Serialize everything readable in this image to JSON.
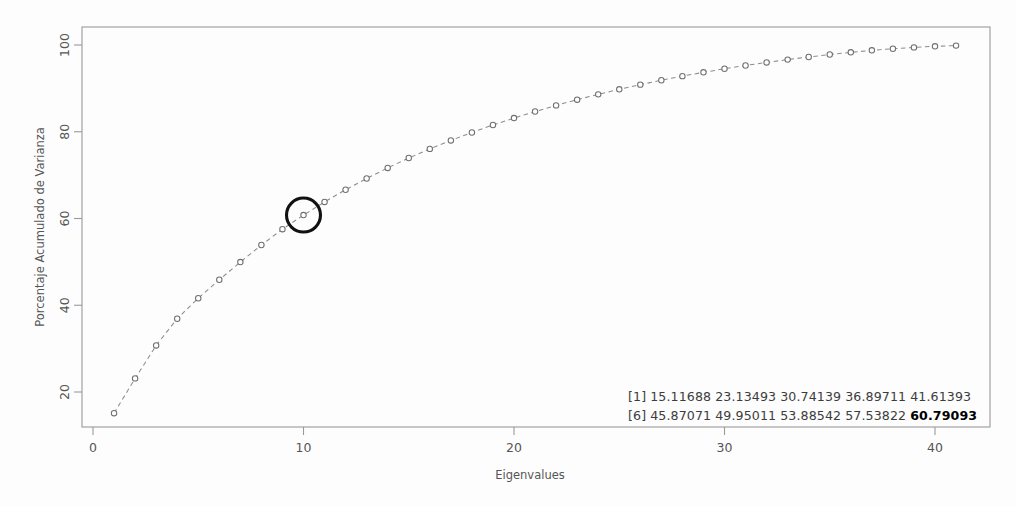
{
  "chart_data": {
    "type": "line",
    "title": "",
    "xlabel": "Eigenvalues",
    "ylabel": "Porcentaje Acumulado de Varianza",
    "xlim": [
      0,
      42.5
    ],
    "ylim": [
      12,
      104
    ],
    "grid": false,
    "legend": "none",
    "marker": "open-circle",
    "linestyle": "dashed",
    "xticks": [
      0,
      10,
      20,
      30,
      40
    ],
    "xtick_labels": [
      "0",
      "10",
      "20",
      "30",
      "40"
    ],
    "yticks": [
      20,
      40,
      60,
      80,
      100
    ],
    "ytick_labels": [
      "20",
      "40",
      "60",
      "80",
      "100"
    ],
    "x": [
      1,
      2,
      3,
      4,
      5,
      6,
      7,
      8,
      9,
      10,
      11,
      12,
      13,
      14,
      15,
      16,
      17,
      18,
      19,
      20,
      21,
      22,
      23,
      24,
      25,
      26,
      27,
      28,
      29,
      30,
      31,
      32,
      33,
      34,
      35,
      36,
      37,
      38,
      39,
      40,
      41
    ],
    "values": [
      15.11688,
      23.13493,
      30.74139,
      36.89711,
      41.61393,
      45.87071,
      49.95011,
      53.88542,
      57.53822,
      60.79093,
      63.82,
      66.62,
      69.22,
      71.66,
      73.95,
      76.05,
      78.0,
      79.83,
      81.55,
      83.15,
      84.66,
      86.08,
      87.4,
      88.62,
      89.78,
      90.86,
      91.88,
      92.82,
      93.7,
      94.52,
      95.28,
      95.98,
      96.63,
      97.24,
      97.8,
      98.31,
      98.77,
      99.14,
      99.45,
      99.7,
      99.86
    ],
    "highlight": {
      "index": 10,
      "x": 10,
      "y": 60.79093,
      "label": "60.79093",
      "style": "black-ring",
      "color": "#111111"
    },
    "annotations": {
      "console": {
        "lines": [
          {
            "index_label": "[1]",
            "values": [
              "15.11688",
              "23.13493",
              "30.74139",
              "36.89711",
              "41.61393"
            ],
            "bold_index": -1
          },
          {
            "index_label": "[6]",
            "values": [
              "45.87071",
              "49.95011",
              "53.88542",
              "57.53822",
              "60.79093"
            ],
            "bold_index": 4
          }
        ]
      }
    }
  },
  "axes": {
    "x_title": "Eigenvalues",
    "y_title": "Porcentaje Acumulado de Varianza",
    "x_tick_labels": [
      "0",
      "10",
      "20",
      "30",
      "40"
    ],
    "y_tick_labels": [
      "20",
      "40",
      "60",
      "80",
      "100"
    ]
  },
  "console": {
    "line1_index": "[1]",
    "line1_text": "15.11688 23.13493 30.74139 36.89711 41.61393",
    "line2_index": "[6]",
    "line2_text": "45.87071 49.95011 53.88542 57.53822 ",
    "line2_bold": "60.79093"
  },
  "colors": {
    "frame": "#9a9a9a",
    "marker_stroke": "#6f6f6f",
    "line": "#8d8d8d",
    "highlight": "#111111",
    "text": "#555555",
    "background": "#fdfdfd"
  }
}
